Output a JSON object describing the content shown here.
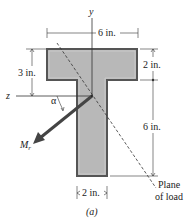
{
  "figure": {
    "caption": "(a)",
    "axes": {
      "y_label": "y",
      "z_label": "z"
    },
    "dimensions": {
      "flange_width": "6 in.",
      "flange_height": "2 in.",
      "top_to_centroid": "3 in.",
      "web_height": "6 in.",
      "web_width": "2 in."
    },
    "moment": {
      "label_main": "M",
      "label_sub": "r",
      "angle_label": "α"
    },
    "plane_of_load": {
      "line1": "Plane",
      "line2": "of load"
    },
    "colors": {
      "section_fill": "#b8b8b8",
      "section_edge": "#555555",
      "arrow": "#444444",
      "lines": "#333333"
    }
  }
}
